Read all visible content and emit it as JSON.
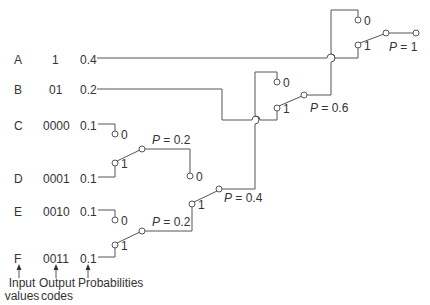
{
  "rows": [
    {
      "symbol": "A",
      "code": "1",
      "prob": "0.4"
    },
    {
      "symbol": "B",
      "code": "01",
      "prob": "0.2"
    },
    {
      "symbol": "C",
      "code": "0000",
      "prob": "0.1"
    },
    {
      "symbol": "D",
      "code": "0001",
      "prob": "0.1"
    },
    {
      "symbol": "E",
      "code": "0010",
      "prob": "0.1"
    },
    {
      "symbol": "F",
      "code": "0011",
      "prob": "0.1"
    }
  ],
  "captions": {
    "inputs": [
      "Input",
      "values"
    ],
    "outputs": [
      "Output",
      "codes"
    ],
    "probabilities": "Probabilities"
  },
  "switch_labels": {
    "zero": "0",
    "one": "1"
  },
  "nodes": [
    {
      "id": "CD",
      "label": "P = 0.2",
      "p": "0.2"
    },
    {
      "id": "EF",
      "label": "P = 0.2",
      "p": "0.2"
    },
    {
      "id": "CDEF",
      "label": "P = 0.4",
      "p": "0.4"
    },
    {
      "id": "BCDEF",
      "label": "P = 0.6",
      "p": "0.6"
    },
    {
      "id": "root",
      "label": "P = 1",
      "p": "1"
    }
  ],
  "colors": {
    "line": "#555555",
    "text": "#333333",
    "background": "#ffffff"
  }
}
